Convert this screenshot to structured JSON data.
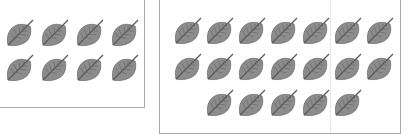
{
  "figure": {
    "left_group": {
      "label": "",
      "count": 8,
      "rows": [
        4,
        4
      ],
      "origin": [
        5,
        18
      ],
      "spacing": [
        35,
        35
      ]
    },
    "right_group": {
      "label": "",
      "count": 19,
      "rows": [
        7,
        7,
        5
      ],
      "origin": [
        13,
        16
      ],
      "spacing": [
        32,
        36
      ],
      "row_offsets": [
        0,
        0,
        32
      ]
    },
    "leaf_icon": "leaf-icon",
    "colors": {
      "leaf_fill": "#8c8c8c",
      "leaf_edge": "#6e6e6e",
      "vein": "#5a5a5a",
      "border": "#a9a9a9"
    }
  }
}
